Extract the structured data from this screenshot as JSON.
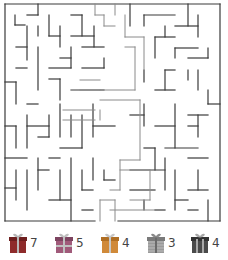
{
  "puzzle": {
    "title": "Gift Maze",
    "grid": {
      "cols": 20,
      "rows": 20,
      "x0": 5,
      "y0": 4,
      "cell": 10.8
    },
    "colors": {
      "wall": "#3a3a3a",
      "path": "#8a8a8a",
      "background": "#ffffff"
    }
  },
  "maze": {
    "walls": [
      [
        5,
        4,
        220,
        4
      ],
      [
        5,
        4,
        5,
        221
      ],
      [
        220,
        4,
        220,
        221
      ],
      [
        5,
        221,
        95,
        221
      ],
      [
        118,
        221,
        220,
        221
      ],
      [
        15,
        15,
        15,
        25
      ],
      [
        15,
        25,
        25,
        25
      ],
      [
        38,
        4,
        38,
        15
      ],
      [
        27,
        15,
        38,
        15
      ],
      [
        38,
        26,
        38,
        36
      ],
      [
        27,
        26,
        27,
        60
      ],
      [
        16,
        47,
        27,
        47
      ],
      [
        16,
        68,
        27,
        68
      ],
      [
        5,
        82,
        16,
        82
      ],
      [
        16,
        82,
        16,
        104
      ],
      [
        27,
        104,
        38,
        104
      ],
      [
        49,
        15,
        49,
        36
      ],
      [
        49,
        36,
        60,
        36
      ],
      [
        60,
        26,
        60,
        47
      ],
      [
        60,
        58,
        71,
        58
      ],
      [
        71,
        47,
        71,
        68
      ],
      [
        49,
        68,
        71,
        68
      ],
      [
        38,
        47,
        38,
        90
      ],
      [
        49,
        79,
        60,
        79
      ],
      [
        60,
        79,
        60,
        100
      ],
      [
        71,
        15,
        82,
        15
      ],
      [
        82,
        15,
        82,
        36
      ],
      [
        71,
        36,
        94,
        36
      ],
      [
        94,
        26,
        94,
        47
      ],
      [
        82,
        47,
        104,
        47
      ],
      [
        104,
        58,
        104,
        68
      ],
      [
        82,
        68,
        104,
        68
      ],
      [
        71,
        90,
        104,
        90
      ],
      [
        5,
        126,
        16,
        126
      ],
      [
        16,
        126,
        16,
        148
      ],
      [
        27,
        115,
        27,
        148
      ],
      [
        27,
        126,
        49,
        126
      ],
      [
        49,
        115,
        49,
        137
      ],
      [
        38,
        137,
        49,
        137
      ],
      [
        60,
        104,
        60,
        137
      ],
      [
        60,
        148,
        82,
        148
      ],
      [
        71,
        115,
        71,
        137
      ],
      [
        82,
        115,
        82,
        148
      ],
      [
        93,
        104,
        93,
        137
      ],
      [
        93,
        126,
        115,
        126
      ],
      [
        5,
        158,
        27,
        158
      ],
      [
        16,
        170,
        16,
        200
      ],
      [
        27,
        170,
        27,
        210
      ],
      [
        5,
        188,
        16,
        188
      ],
      [
        38,
        158,
        38,
        190
      ],
      [
        38,
        170,
        49,
        170
      ],
      [
        49,
        158,
        60,
        158
      ],
      [
        60,
        170,
        60,
        200
      ],
      [
        49,
        200,
        71,
        200
      ],
      [
        71,
        158,
        71,
        221
      ],
      [
        82,
        170,
        82,
        190
      ],
      [
        82,
        190,
        93,
        190
      ],
      [
        93,
        158,
        93,
        180
      ],
      [
        104,
        170,
        104,
        180
      ],
      [
        104,
        180,
        115,
        180
      ],
      [
        82,
        210,
        93,
        210
      ],
      [
        130,
        4,
        130,
        26
      ],
      [
        144,
        15,
        175,
        15
      ],
      [
        144,
        15,
        144,
        26
      ],
      [
        165,
        26,
        165,
        37
      ],
      [
        188,
        4,
        188,
        26
      ],
      [
        198,
        15,
        198,
        37
      ],
      [
        175,
        26,
        198,
        26
      ],
      [
        155,
        37,
        175,
        37
      ],
      [
        155,
        37,
        155,
        58
      ],
      [
        175,
        48,
        198,
        48
      ],
      [
        175,
        48,
        175,
        58
      ],
      [
        208,
        48,
        208,
        58
      ],
      [
        188,
        58,
        208,
        58
      ],
      [
        188,
        70,
        188,
        80
      ],
      [
        198,
        70,
        198,
        90
      ],
      [
        165,
        70,
        175,
        70
      ],
      [
        165,
        70,
        165,
        90
      ],
      [
        155,
        90,
        175,
        90
      ],
      [
        144,
        70,
        144,
        82
      ],
      [
        208,
        90,
        208,
        104
      ],
      [
        208,
        104,
        220,
        104
      ],
      [
        188,
        115,
        208,
        115
      ],
      [
        198,
        115,
        198,
        137
      ],
      [
        130,
        115,
        144,
        115
      ],
      [
        144,
        104,
        144,
        126
      ],
      [
        155,
        126,
        175,
        126
      ],
      [
        175,
        104,
        175,
        148
      ],
      [
        165,
        148,
        198,
        148
      ],
      [
        188,
        126,
        198,
        126
      ],
      [
        144,
        148,
        155,
        148
      ],
      [
        155,
        148,
        155,
        170
      ],
      [
        130,
        170,
        165,
        170
      ],
      [
        165,
        158,
        165,
        190
      ],
      [
        175,
        170,
        175,
        210
      ],
      [
        188,
        158,
        208,
        158
      ],
      [
        198,
        170,
        198,
        190
      ],
      [
        188,
        190,
        208,
        190
      ],
      [
        208,
        200,
        208,
        221
      ],
      [
        130,
        190,
        155,
        190
      ],
      [
        144,
        200,
        144,
        210
      ],
      [
        175,
        200,
        188,
        200
      ],
      [
        188,
        210,
        198,
        210
      ],
      [
        155,
        210,
        165,
        210
      ]
    ],
    "solution_path": [
      [
        95,
        4,
        95,
        15
      ],
      [
        95,
        15,
        104,
        15
      ],
      [
        104,
        15,
        104,
        26
      ],
      [
        104,
        26,
        115,
        26
      ],
      [
        115,
        4,
        115,
        15
      ],
      [
        125,
        15,
        125,
        37
      ],
      [
        125,
        37,
        144,
        37
      ],
      [
        144,
        37,
        144,
        70
      ],
      [
        125,
        47,
        135,
        47
      ],
      [
        135,
        47,
        135,
        90
      ],
      [
        100,
        90,
        135,
        90
      ],
      [
        100,
        100,
        140,
        100
      ],
      [
        140,
        100,
        140,
        160
      ],
      [
        120,
        160,
        140,
        160
      ],
      [
        120,
        170,
        150,
        170
      ],
      [
        150,
        170,
        150,
        200
      ],
      [
        130,
        200,
        150,
        200
      ],
      [
        120,
        160,
        120,
        190
      ],
      [
        110,
        190,
        120,
        190
      ],
      [
        110,
        210,
        160,
        210
      ],
      [
        100,
        200,
        100,
        221
      ],
      [
        115,
        200,
        115,
        221
      ],
      [
        100,
        200,
        115,
        200
      ],
      [
        80,
        80,
        100,
        80
      ],
      [
        80,
        90,
        100,
        90
      ],
      [
        63,
        110,
        95,
        110
      ],
      [
        63,
        120,
        95,
        120
      ],
      [
        100,
        110,
        100,
        120
      ]
    ]
  },
  "gifts": [
    {
      "name": "gift-red",
      "count": "7",
      "box": "#8e2b2b",
      "ribbon": "#b8b8b8",
      "x": 4
    },
    {
      "name": "gift-purple",
      "count": "5",
      "box": "#a05a7a",
      "ribbon": "#c0c0c0",
      "x": 50
    },
    {
      "name": "gift-orange",
      "count": "4",
      "box": "#d08a3a",
      "ribbon": "#c8c8c8",
      "x": 96
    },
    {
      "name": "gift-striped",
      "count": "3",
      "box": "#9a9a9a",
      "ribbon": "#c4c4c4",
      "x": 142
    },
    {
      "name": "gift-dark",
      "count": "4",
      "box": "#4a4a4a",
      "ribbon": "#a8a8a8",
      "x": 186
    }
  ]
}
